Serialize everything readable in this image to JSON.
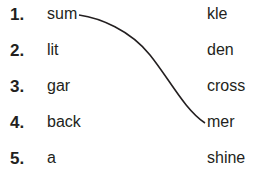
{
  "exercise": {
    "items": [
      {
        "number": "1.",
        "left": "sum",
        "right": "kle"
      },
      {
        "number": "2.",
        "left": "lit",
        "right": "den"
      },
      {
        "number": "3.",
        "left": "gar",
        "right": "cross"
      },
      {
        "number": "4.",
        "left": "back",
        "right": "mer"
      },
      {
        "number": "5.",
        "left": "a",
        "right": "shine"
      }
    ],
    "connections": [
      {
        "from_left": "sum",
        "to_right": "mer"
      }
    ],
    "line_color": "#231f20"
  }
}
